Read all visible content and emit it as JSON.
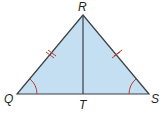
{
  "diagram": {
    "type": "isosceles-triangle",
    "vertices": [
      {
        "id": "R",
        "label": "R"
      },
      {
        "id": "Q",
        "label": "Q"
      },
      {
        "id": "S",
        "label": "S"
      },
      {
        "id": "T",
        "label": "T"
      }
    ],
    "segments": [
      "RQ",
      "RS",
      "QS",
      "RT"
    ],
    "congruent_sides": [
      "RQ",
      "RS"
    ],
    "congruent_angles": [
      "Q",
      "S"
    ],
    "colors": {
      "fill": "#c5dff2",
      "stroke": "#3a3f45",
      "marks": "#c0392b",
      "text": "#231f20"
    }
  }
}
